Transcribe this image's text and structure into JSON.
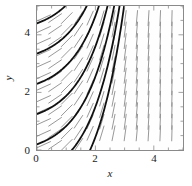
{
  "chart_data": {
    "type": "line",
    "title": "",
    "subtitle": "",
    "xlabel": "x",
    "ylabel": "y",
    "xlim": [
      0,
      5
    ],
    "ylim": [
      0,
      5
    ],
    "xticks": [
      0,
      2,
      4
    ],
    "yticks": [
      0,
      2,
      4
    ],
    "xtick_labels": [
      "0",
      "2",
      "4"
    ],
    "ytick_labels": [
      "0",
      "2",
      "4"
    ],
    "minor_tick_step": 0.5,
    "grid": false,
    "legend": null,
    "annotations": [],
    "slope_field": {
      "style": "dashed-gray-segments",
      "color": "#8c8c8c",
      "grid_step_x": 0.4,
      "grid_step_y": 0.4,
      "segment_length": 0.28,
      "slope_formula": "dy/dx = exp(x - 1) ; slope grows with x, independent of y",
      "slope_samples": [
        {
          "x": 0.2,
          "slope": 0.45
        },
        {
          "x": 1.0,
          "slope": 1.0
        },
        {
          "x": 2.0,
          "slope": 2.7
        },
        {
          "x": 3.0,
          "slope": 7.4
        },
        {
          "x": 4.0,
          "slope": 20.1
        },
        {
          "x": 4.6,
          "slope": 36.6
        }
      ]
    },
    "solution_curves": {
      "color": "#111111",
      "linewidth": 1.8,
      "family": "y = exp(x-1) - exp(-1) + C",
      "count": 7,
      "x_axis_crossings": [
        1.0,
        2.5,
        4.0
      ],
      "y_axis_crossings": [
        0.2,
        1.2,
        2.3,
        3.3,
        4.4
      ],
      "series": [
        {
          "name": "C1",
          "c": -2.1
        },
        {
          "name": "C2",
          "c": -1.05
        },
        {
          "name": "C3",
          "c": 0.0
        },
        {
          "name": "C4",
          "c": 1.05
        },
        {
          "name": "C5",
          "c": 2.1
        },
        {
          "name": "C6",
          "c": 3.15
        },
        {
          "name": "C7",
          "c": 4.2
        }
      ]
    }
  },
  "axes": {
    "x_label": "x",
    "y_label": "y",
    "x_tick_labels": [
      "0",
      "2",
      "4"
    ],
    "y_tick_labels": [
      "0",
      "2",
      "4"
    ]
  },
  "colors": {
    "frame": "#8a8a8a",
    "curve": "#111111",
    "field": "#8c8c8c",
    "background": "#ffffff",
    "text": "#1a1a1a"
  }
}
